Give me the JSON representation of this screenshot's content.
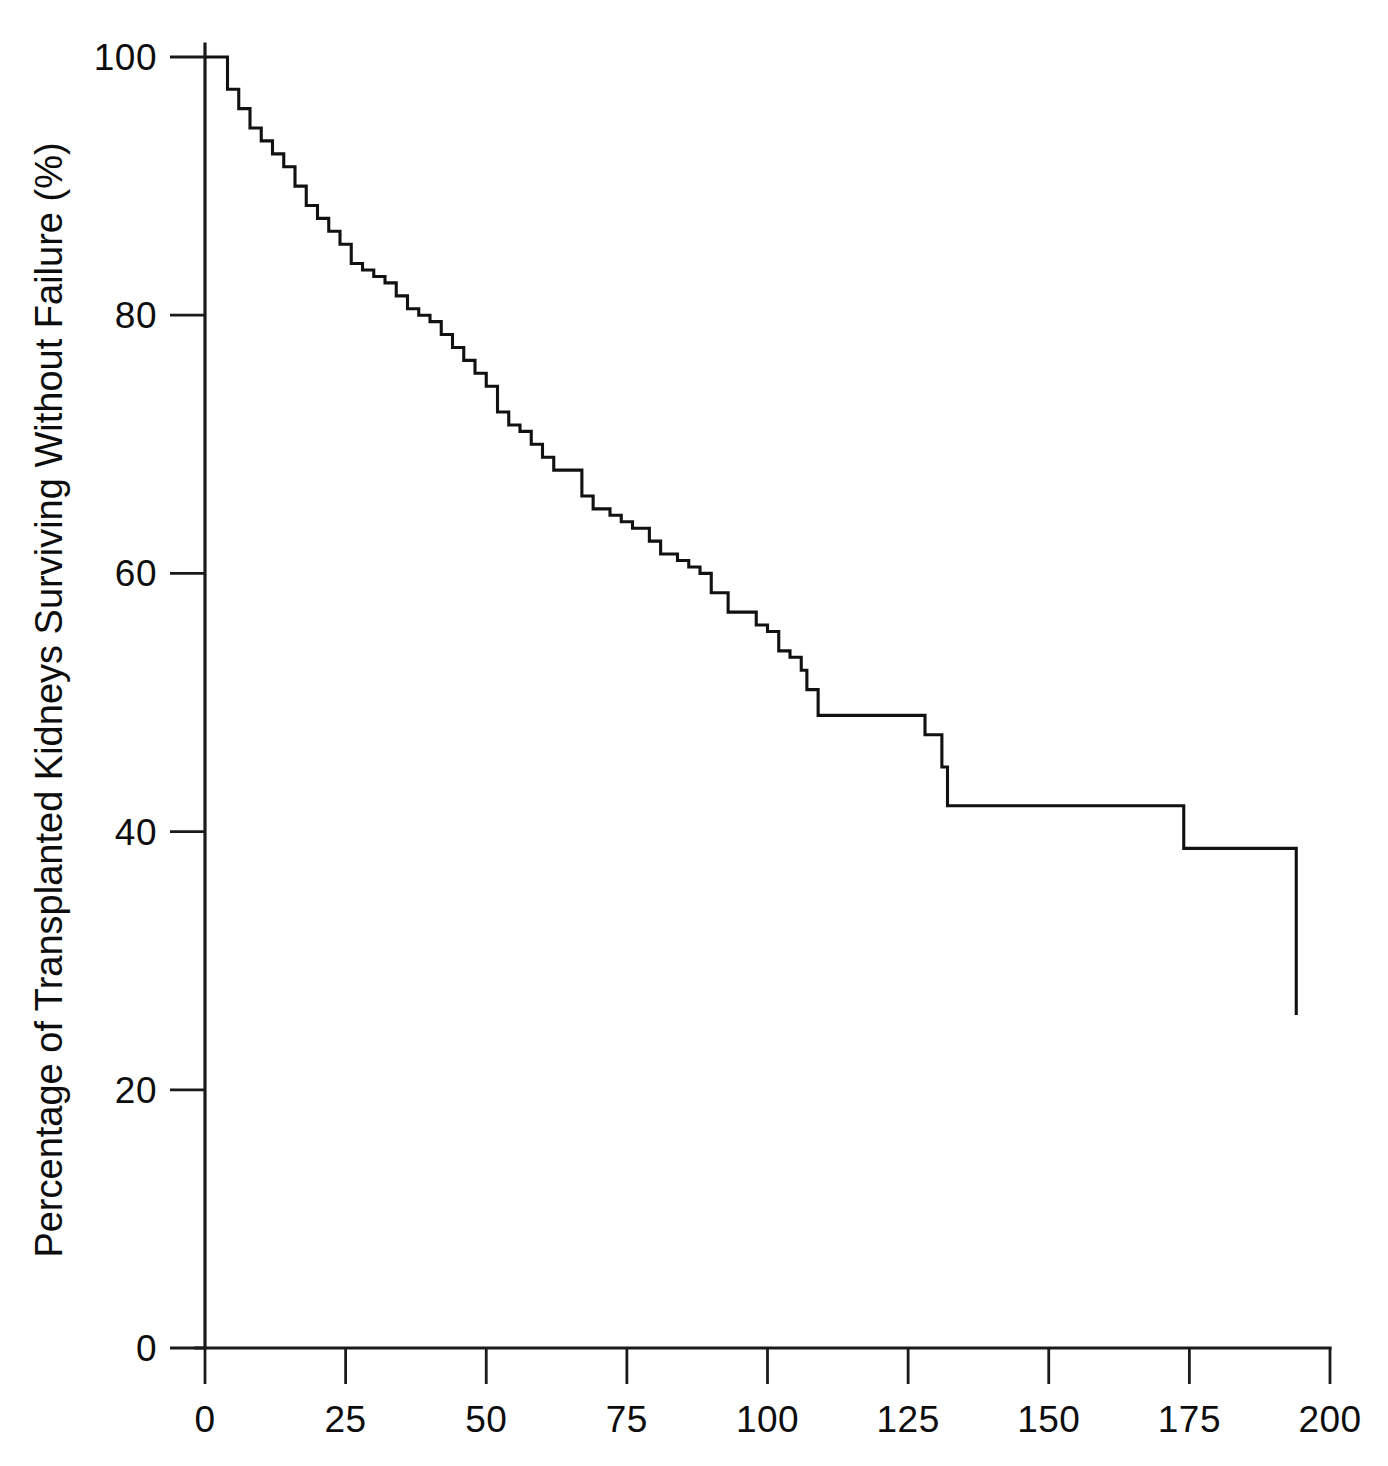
{
  "chart_data": {
    "type": "line",
    "subtype": "kaplan-meier-step",
    "title": "",
    "xlabel": "",
    "ylabel": "Percentage of Transplanted Kidneys Surviving Without Failure (%)",
    "xlim": [
      0,
      200
    ],
    "ylim": [
      0,
      100
    ],
    "xticks": [
      0,
      25,
      50,
      75,
      100,
      125,
      150,
      175,
      200
    ],
    "xtick_labels": [
      "0",
      "25",
      "50",
      "75",
      "100",
      "125",
      "150",
      "175",
      "200"
    ],
    "yticks": [
      0,
      20,
      40,
      60,
      80,
      100
    ],
    "ytick_labels": [
      "0",
      "20",
      "40",
      "60",
      "80",
      "100"
    ],
    "grid": false,
    "legend": false,
    "legend_position": "none",
    "line_color": "#111111",
    "background_color": "#ffffff",
    "axis_color": "#1a1a1a",
    "series": [
      {
        "name": "Transplanted kidney survival",
        "step_type": "post",
        "x": [
          0,
          2,
          4,
          6,
          8,
          10,
          12,
          14,
          16,
          18,
          20,
          22,
          24,
          26,
          28,
          30,
          32,
          34,
          36,
          38,
          40,
          42,
          44,
          46,
          48,
          50,
          52,
          54,
          56,
          58,
          60,
          62,
          65,
          67,
          69,
          72,
          74,
          76,
          79,
          81,
          84,
          86,
          88,
          90,
          93,
          96,
          98,
          100,
          102,
          104,
          106,
          107,
          109,
          128,
          129,
          131,
          132,
          174,
          194
        ],
        "y": [
          100,
          100,
          97.5,
          96,
          94.5,
          93.5,
          92.5,
          91.5,
          90,
          88.5,
          87.5,
          86.5,
          85.5,
          84,
          83.5,
          83,
          82.5,
          81.5,
          80.5,
          80,
          79.5,
          78.5,
          77.5,
          76.5,
          75.5,
          74.5,
          72.5,
          71.5,
          71,
          70,
          69,
          68,
          68,
          66,
          65,
          64.5,
          64,
          63.5,
          62.5,
          61.5,
          61,
          60.5,
          60,
          58.5,
          57,
          57,
          56,
          55.5,
          54,
          53.5,
          52.5,
          51,
          49,
          47.5,
          47.5,
          45,
          42,
          38.7,
          25.8
        ]
      }
    ]
  },
  "axis": {
    "y_title": "Percentage of Transplanted Kidneys Surviving Without Failure (%)"
  }
}
